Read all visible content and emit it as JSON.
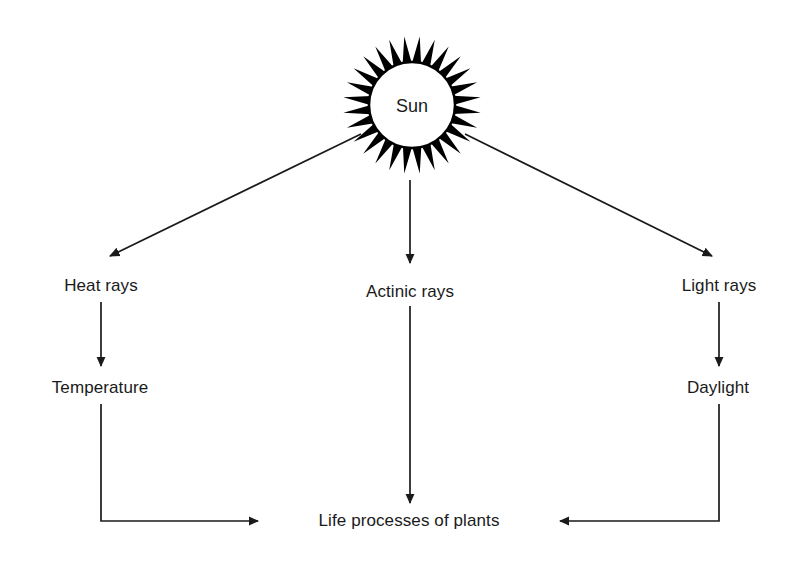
{
  "diagram": {
    "colors": {
      "background": "#ffffff",
      "stroke": "#1a1a1a",
      "sun_fill": "#ffffff",
      "sun_spikes": "#000000",
      "text": "#1a1a1a"
    },
    "nodes": {
      "sun": "Sun",
      "heat_rays": "Heat rays",
      "actinic_rays": "Actinic rays",
      "light_rays": "Light rays",
      "temperature": "Temperature",
      "daylight": "Daylight",
      "life_processes": "Life processes of plants"
    },
    "edges": [
      {
        "from": "sun",
        "to": "heat_rays",
        "style": "diagonal-arrow"
      },
      {
        "from": "sun",
        "to": "actinic_rays",
        "style": "vertical-arrow"
      },
      {
        "from": "sun",
        "to": "light_rays",
        "style": "diagonal-arrow"
      },
      {
        "from": "heat_rays",
        "to": "temperature",
        "style": "vertical-arrow"
      },
      {
        "from": "light_rays",
        "to": "daylight",
        "style": "vertical-arrow"
      },
      {
        "from": "temperature",
        "to": "life_processes",
        "style": "elbow-arrow"
      },
      {
        "from": "actinic_rays",
        "to": "life_processes",
        "style": "vertical-arrow"
      },
      {
        "from": "daylight",
        "to": "life_processes",
        "style": "elbow-arrow"
      }
    ],
    "sun_glyph": {
      "spike_count": 28,
      "center_x": 412,
      "center_y": 105,
      "inner_radius": 43,
      "outer_radius": 69
    }
  }
}
